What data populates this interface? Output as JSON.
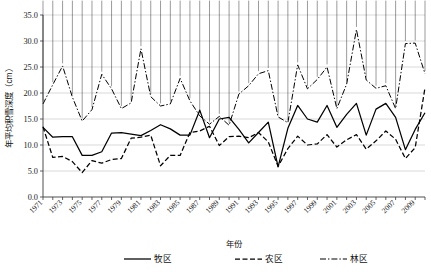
{
  "chart_data": {
    "type": "line",
    "title": "",
    "xlabel": "年份",
    "ylabel": "年平均积雪深度（cm）",
    "ylim": [
      0,
      35
    ],
    "ytick_labels": [
      "0.0",
      "5.0",
      "10.0",
      "15.0",
      "20.0",
      "25.0",
      "30.0",
      "35.0"
    ],
    "ytick_values": [
      0,
      5,
      10,
      15,
      20,
      25,
      30,
      35
    ],
    "grid": "horizontal",
    "legend_position": "bottom",
    "x": [
      1971,
      1972,
      1973,
      1974,
      1975,
      1976,
      1977,
      1978,
      1979,
      1980,
      1981,
      1982,
      1983,
      1984,
      1985,
      1986,
      1987,
      1988,
      1989,
      1990,
      1991,
      1992,
      1993,
      1994,
      1995,
      1996,
      1997,
      1998,
      1999,
      2000,
      2001,
      2002,
      2003,
      2004,
      2005,
      2006,
      2007,
      2008,
      2009,
      2010
    ],
    "xtick_labels": [
      "1971",
      "1973",
      "1975",
      "1977",
      "1979",
      "1981",
      "1983",
      "1985",
      "1987",
      "1989",
      "1991",
      "1993",
      "1995",
      "1997",
      "1999",
      "2001",
      "2003",
      "2005",
      "2007",
      "2009"
    ],
    "series": [
      {
        "name": "牧区",
        "style": "solid",
        "marker": "none",
        "color": "#000000",
        "values": [
          13.4,
          11.5,
          11.6,
          11.6,
          8.0,
          8.0,
          8.7,
          12.3,
          12.4,
          12.1,
          11.8,
          12.8,
          13.9,
          13.1,
          11.9,
          11.9,
          16.7,
          11.4,
          15.0,
          15.3,
          13.0,
          10.4,
          12.4,
          14.4,
          5.8,
          13.2,
          17.6,
          15.0,
          14.4,
          17.6,
          13.4,
          15.9,
          18.0,
          11.9,
          16.9,
          18.0,
          15.3,
          9.1,
          13.0,
          16.2
        ]
      },
      {
        "name": "农区",
        "style": "dashed",
        "marker": "none",
        "color": "#000000",
        "values": [
          13.5,
          7.6,
          7.8,
          6.8,
          4.7,
          7.0,
          6.5,
          7.2,
          7.4,
          11.3,
          11.5,
          11.9,
          6.0,
          8.0,
          8.0,
          12.4,
          12.7,
          13.6,
          9.9,
          11.6,
          11.7,
          11.4,
          12.4,
          10.6,
          5.9,
          9.3,
          11.7,
          10.0,
          10.2,
          12.0,
          9.6,
          11.0,
          12.0,
          9.2,
          10.8,
          12.7,
          11.1,
          7.4,
          9.5,
          21.0
        ]
      },
      {
        "name": "林区",
        "style": "dashdot",
        "marker": "diamond",
        "color": "#000000",
        "values": [
          17.9,
          21.6,
          25.2,
          19.2,
          14.6,
          16.8,
          23.6,
          20.8,
          17.0,
          18.1,
          28.5,
          19.3,
          17.5,
          17.9,
          22.8,
          18.5,
          15.6,
          14.0,
          15.5,
          13.8,
          19.8,
          21.4,
          23.7,
          24.3,
          15.4,
          14.3,
          25.4,
          20.8,
          22.6,
          25.0,
          17.0,
          21.7,
          32.2,
          22.5,
          20.9,
          21.4,
          17.0,
          29.5,
          29.6,
          23.7
        ]
      }
    ]
  },
  "legend": {
    "items": [
      {
        "label": "牧区",
        "style": "solid",
        "marker": "none"
      },
      {
        "label": "农区",
        "style": "dashed",
        "marker": "none"
      },
      {
        "label": "林区",
        "style": "dashdot",
        "marker": "none"
      }
    ]
  }
}
